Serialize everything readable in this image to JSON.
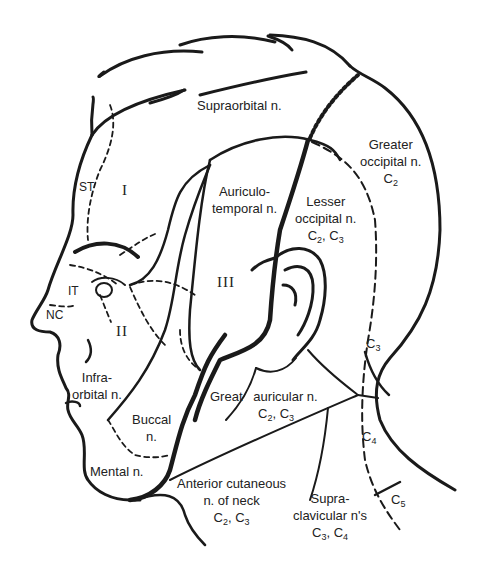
{
  "figure": {
    "type": "anatomical sensory nerve distribution diagram, head and neck, left lateral view",
    "labels": {
      "supraorbital": "Supraorbital n.",
      "greater_occipital": {
        "line1": "Greater",
        "line2": "occipital n.",
        "seg": "C",
        "seg_num": "2"
      },
      "auriculotemporal": {
        "line1": "Auriculo-",
        "line2": "temporal n."
      },
      "lesser_occipital": {
        "line1": "Lesser",
        "line2": "occipital n.",
        "seg_a": "C",
        "num_a": "2",
        "seg_b": "C",
        "num_b": "3"
      },
      "st": "ST",
      "it": "IT",
      "nc": "NC",
      "division_1": "I",
      "division_2": "II",
      "division_3": "III",
      "infraorbital": {
        "line1": "Infra-",
        "line2": "orbital n."
      },
      "buccal": {
        "line1": "Buccal",
        "line2": "n."
      },
      "mental": "Mental n.",
      "great_auricular": {
        "line1a": "Great",
        "line1b": "auricular n.",
        "seg_a": "C",
        "num_a": "2",
        "seg_b": "C",
        "num_b": "3"
      },
      "anterior_cutaneous": {
        "line1": "Anterior cutaneous",
        "line2": "n. of neck",
        "seg_a": "C",
        "num_a": "2",
        "seg_b": "C",
        "num_b": "3"
      },
      "supraclavicular": {
        "line1": "Supra-",
        "line2": "clavicular n's",
        "seg_a": "C",
        "num_a": "3",
        "seg_b": "C",
        "num_b": "4"
      },
      "c3": {
        "seg": "C",
        "num": "3"
      },
      "c4": {
        "seg": "C",
        "num": "4"
      },
      "c5": {
        "seg": "C",
        "num": "5"
      }
    },
    "colors": {
      "ink": "#1a1a1a",
      "background": "#ffffff"
    }
  }
}
